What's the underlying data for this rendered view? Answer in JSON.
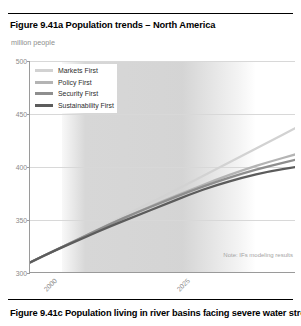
{
  "figure": {
    "title": "Figure 9.41a Population trends – North America",
    "next_figure_caption": "Figure 9.41c Population living in river basins facing severe water stress –",
    "unit_label": "million people",
    "note": "Note: IFs modeling results"
  },
  "legend": {
    "position": "top-left-inside",
    "entries": [
      {
        "label": "Markets First",
        "color": "#d2d2d2"
      },
      {
        "label": "Policy First",
        "color": "#b4b4b4"
      },
      {
        "label": "Security First",
        "color": "#8e8e8e"
      },
      {
        "label": "Sustainability First",
        "color": "#5c5c5c"
      }
    ]
  },
  "chart_data": {
    "type": "line",
    "title": "Figure 9.41a Population trends – North America",
    "subtitle": "million people",
    "xlabel": "",
    "ylabel": "million people",
    "xlim": [
      2000,
      2050
    ],
    "ylim": [
      300,
      500
    ],
    "yticks": [
      300,
      350,
      400,
      450,
      500
    ],
    "xticks": [
      2000,
      2025,
      2050
    ],
    "xtick_labels": [
      "2000",
      "2025",
      "2050"
    ],
    "grid": true,
    "grid_axis": "y",
    "shaded_band": {
      "x_start": 2006,
      "x_end": 2013,
      "color": "#cdcdcd"
    },
    "annotation": "Note: IFs modeling results",
    "x": [
      2000,
      2005,
      2010,
      2015,
      2020,
      2025,
      2030,
      2035,
      2040,
      2045,
      2050
    ],
    "series": [
      {
        "name": "Markets First",
        "color": "#d2d2d2",
        "values": [
          310,
          322,
          334,
          347,
          360,
          372,
          385,
          398,
          411,
          424,
          437
        ]
      },
      {
        "name": "Policy First",
        "color": "#b4b4b4",
        "values": [
          310,
          322,
          334,
          346,
          357,
          368,
          378,
          388,
          397,
          405,
          412
        ]
      },
      {
        "name": "Security First",
        "color": "#8e8e8e",
        "values": [
          310,
          322,
          334,
          346,
          357,
          367,
          377,
          386,
          394,
          401,
          407
        ]
      },
      {
        "name": "Sustainability First",
        "color": "#5c5c5c",
        "values": [
          310,
          322,
          333,
          344,
          354,
          364,
          374,
          383,
          390,
          396,
          400
        ]
      }
    ]
  }
}
